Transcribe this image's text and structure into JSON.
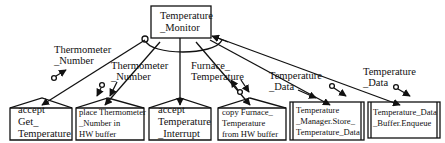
{
  "diagram": {
    "type": "structure-chart",
    "root": {
      "id": "temperature-monitor",
      "label": "Temperature\n_Monitor"
    },
    "modules": [
      {
        "id": "accept-get-temperature",
        "label": "accept\nGet_\nTemperature",
        "kind": "accept"
      },
      {
        "id": "place-thermometer-number",
        "label": "place Thermometer\n_Number in\nHW buffer",
        "kind": "process"
      },
      {
        "id": "accept-temperature-interrupt",
        "label": "accept\nTemperature\n_Interrupt",
        "kind": "accept"
      },
      {
        "id": "copy-furnace-temperature",
        "label": "copy Furnace_\nTemperature\nfrom HW buffer",
        "kind": "process"
      },
      {
        "id": "temperature-manager-store",
        "label": "Temperature\n_Manager.Store_\nTemperature_Data",
        "kind": "library"
      },
      {
        "id": "temperature-data-buffer-enqueue",
        "label": "Temperature_Data\n_Buffer.Enqueue",
        "kind": "library"
      }
    ],
    "couples": [
      {
        "id": "couple-1",
        "label": "Thermometer\n_Number"
      },
      {
        "id": "couple-2",
        "label": "Thermometer\n_Number"
      },
      {
        "id": "couple-3",
        "label": "Furnace_\nTemperature"
      },
      {
        "id": "couple-4",
        "label": "Temperature\n_Data"
      },
      {
        "id": "couple-5",
        "label": "Temperature\n_Data"
      }
    ],
    "colors": {
      "line": "#111111",
      "background": "#ffffff"
    }
  }
}
